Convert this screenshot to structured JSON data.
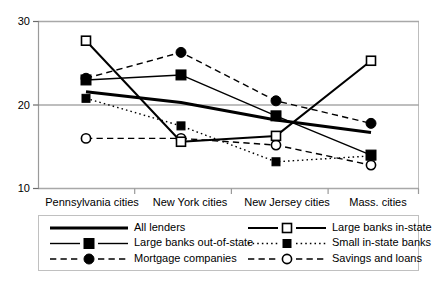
{
  "chart_data": {
    "type": "line",
    "title": "",
    "subtitle": "",
    "xlabel": "",
    "ylabel": "",
    "categories": [
      "Pennsylvania cities",
      "New York cities",
      "New Jersey cities",
      "Mass. cities"
    ],
    "ylim": [
      10,
      30
    ],
    "yticks": [
      10,
      20,
      30
    ],
    "ytick_labels": [
      "10",
      "20",
      "30"
    ],
    "grid": true,
    "grid_axis": "y",
    "legend_position": "bottom",
    "legend_columns": 2,
    "series": [
      {
        "name": "All  lenders",
        "values": [
          21.6,
          20.3,
          18.2,
          16.7
        ],
        "marker": "none",
        "line_style": "solid",
        "line_width": 3.0,
        "color": "#000000"
      },
      {
        "name": "Large banks in-state",
        "values": [
          27.7,
          15.6,
          16.3,
          25.3
        ],
        "marker": "open-square",
        "line_style": "solid",
        "line_width": 2.0,
        "color": "#000000"
      },
      {
        "name": "Large banks out-of-state",
        "values": [
          23.0,
          23.6,
          18.7,
          14.0
        ],
        "marker": "filled-square",
        "line_style": "solid",
        "line_width": 1.4,
        "color": "#000000"
      },
      {
        "name": "Small in-state banks",
        "values": [
          20.8,
          17.5,
          13.2,
          13.9
        ],
        "marker": "filled-square-small",
        "line_style": "dotted",
        "line_width": 1.4,
        "color": "#000000"
      },
      {
        "name": "Mortgage companies",
        "values": [
          23.2,
          26.3,
          20.5,
          17.8
        ],
        "marker": "filled-circle",
        "line_style": "dashed",
        "line_width": 1.4,
        "color": "#000000"
      },
      {
        "name": "Savings and loans",
        "values": [
          16.0,
          16.0,
          15.2,
          12.8
        ],
        "marker": "open-circle",
        "line_style": "dashed",
        "line_width": 1.4,
        "color": "#000000"
      }
    ]
  },
  "legend": {
    "entries": [
      {
        "label": "All  lenders",
        "column": 0,
        "row": 0
      },
      {
        "label": "Large banks out-of-state",
        "column": 0,
        "row": 1
      },
      {
        "label": "Mortgage companies",
        "column": 0,
        "row": 2
      },
      {
        "label": "Large banks in-state",
        "column": 1,
        "row": 0
      },
      {
        "label": "Small in-state banks",
        "column": 1,
        "row": 1
      },
      {
        "label": "Savings and loans",
        "column": 1,
        "row": 2
      }
    ]
  },
  "colors": {
    "ink": "#000000",
    "gridline": "#b0b0b0",
    "frame": "#bdbdbd",
    "background": "#ffffff"
  }
}
